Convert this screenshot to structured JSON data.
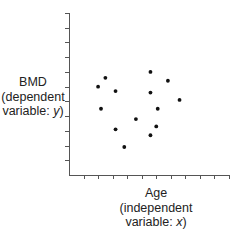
{
  "chart_data": {
    "type": "scatter",
    "title": "",
    "xlabel": "Age (independent variable: x)",
    "ylabel": "BMD (dependent variable: y)",
    "xlabel_lines": [
      "Age",
      "(independent",
      "variable: x)"
    ],
    "ylabel_lines": [
      "BMD",
      "(dependent",
      "variable: y)"
    ],
    "x_tick_count": 11,
    "y_tick_count": 11,
    "tick_labels": "none",
    "grid": false,
    "legend": "none",
    "xlim": [
      0,
      11
    ],
    "ylim": [
      0,
      11
    ],
    "points": [
      {
        "x": 2.0,
        "y": 6.0
      },
      {
        "x": 2.5,
        "y": 6.6
      },
      {
        "x": 3.2,
        "y": 5.7
      },
      {
        "x": 5.6,
        "y": 7.0
      },
      {
        "x": 6.8,
        "y": 6.4
      },
      {
        "x": 5.6,
        "y": 5.6
      },
      {
        "x": 7.6,
        "y": 5.1
      },
      {
        "x": 2.2,
        "y": 4.5
      },
      {
        "x": 6.1,
        "y": 4.5
      },
      {
        "x": 4.6,
        "y": 3.8
      },
      {
        "x": 3.2,
        "y": 3.1
      },
      {
        "x": 6.0,
        "y": 3.3
      },
      {
        "x": 5.6,
        "y": 2.7
      },
      {
        "x": 3.8,
        "y": 1.9
      }
    ],
    "colors": {
      "axis": "#555555",
      "point": "#111111",
      "text": "#222222"
    }
  },
  "labels": {
    "y": [
      "BMD",
      "(dependent",
      "variable: y)"
    ],
    "x": [
      "Age",
      "(independent",
      "variable: x)"
    ]
  }
}
